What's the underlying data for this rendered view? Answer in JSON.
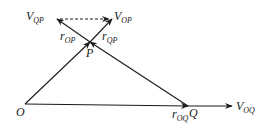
{
  "diagram": {
    "type": "relative-velocity-vector-diagram",
    "colors": {
      "stroke": "#1a1a1a",
      "background": "#ffffff"
    },
    "points": {
      "O": {
        "label": "O",
        "x": 25,
        "y": 104
      },
      "P": {
        "label": "P",
        "x": 90,
        "y": 42
      },
      "Q": {
        "label": "Q",
        "x": 188,
        "y": 106
      }
    },
    "labels": {
      "origin": "O",
      "point_p": "P",
      "point_q": "Q",
      "r_op_main": "r",
      "r_op_sub": "OP",
      "r_qp_main": "r",
      "r_qp_sub": "QP",
      "r_oq_main": "r",
      "r_oq_sub": "OQ",
      "v_qp_main": "V",
      "v_qp_sub": "QP",
      "v_op_main": "V",
      "v_op_sub": "OP",
      "v_oq_main": "V",
      "v_oq_sub": "OQ"
    },
    "vectors": [
      {
        "name": "r_OP",
        "from": "O",
        "to": "P",
        "style": "solid"
      },
      {
        "name": "r_QP",
        "from": "Q",
        "to": "P",
        "style": "solid"
      },
      {
        "name": "r_OQ",
        "from": "O",
        "to": "Q",
        "style": "solid"
      },
      {
        "name": "V_OQ",
        "from": "Q",
        "to": "V_OQ tip",
        "style": "solid"
      },
      {
        "name": "V_OP",
        "from": "P",
        "to": "V_OP tip",
        "style": "solid"
      },
      {
        "name": "V_QP",
        "from": "P",
        "to": "V_QP tip",
        "style": "solid"
      },
      {
        "name": "V_QP_to_V_OP",
        "from": "V_QP tip",
        "to": "V_OP tip",
        "style": "dashed"
      }
    ]
  }
}
